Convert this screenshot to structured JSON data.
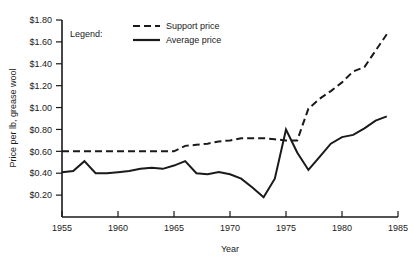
{
  "chart_data": {
    "type": "line",
    "title": "",
    "xlabel": "Year",
    "ylabel": "Price per lb, grease wool",
    "xlim": [
      1955,
      1985
    ],
    "ylim": [
      0,
      1.8
    ],
    "grid": false,
    "legend_position": "top-left",
    "legend_title": "Legend:",
    "xticks": [
      1955,
      1960,
      1965,
      1970,
      1975,
      1980,
      1985
    ],
    "xtick_labels": [
      "1955",
      "1960",
      "1965",
      "1970",
      "1975",
      "1980",
      "1985"
    ],
    "yticks": [
      0.2,
      0.4,
      0.6,
      0.8,
      1.0,
      1.2,
      1.4,
      1.6,
      1.8
    ],
    "ytick_labels": [
      "$0.20",
      "$0.40",
      "$0.60",
      "$0.80",
      "$1.00",
      "$1.20",
      "$1.40",
      "$1.60",
      "$1.80"
    ],
    "series": [
      {
        "name": "Support price",
        "style": "dashed",
        "color": "#1a1a1a",
        "x": [
          1955,
          1956,
          1957,
          1958,
          1959,
          1960,
          1961,
          1962,
          1963,
          1964,
          1965,
          1966,
          1967,
          1968,
          1969,
          1970,
          1971,
          1972,
          1973,
          1974,
          1975,
          1976,
          1977,
          1978,
          1979,
          1980,
          1981,
          1982,
          1983,
          1984
        ],
        "values": [
          0.6,
          0.6,
          0.6,
          0.6,
          0.6,
          0.6,
          0.6,
          0.6,
          0.6,
          0.6,
          0.6,
          0.65,
          0.66,
          0.67,
          0.69,
          0.7,
          0.72,
          0.72,
          0.72,
          0.71,
          0.7,
          0.7,
          0.99,
          1.08,
          1.15,
          1.23,
          1.33,
          1.37,
          1.52,
          1.67
        ]
      },
      {
        "name": "Average price",
        "style": "solid",
        "color": "#1a1a1a",
        "x": [
          1955,
          1956,
          1957,
          1958,
          1959,
          1960,
          1961,
          1962,
          1963,
          1964,
          1965,
          1966,
          1967,
          1968,
          1969,
          1970,
          1971,
          1972,
          1973,
          1974,
          1975,
          1976,
          1977,
          1978,
          1979,
          1980,
          1981,
          1982,
          1983,
          1984
        ],
        "values": [
          0.41,
          0.42,
          0.51,
          0.4,
          0.4,
          0.41,
          0.42,
          0.44,
          0.45,
          0.44,
          0.47,
          0.51,
          0.4,
          0.39,
          0.41,
          0.39,
          0.35,
          0.27,
          0.18,
          0.35,
          0.8,
          0.59,
          0.43,
          0.55,
          0.67,
          0.73,
          0.75,
          0.81,
          0.88,
          0.92
        ]
      }
    ],
    "annotations": []
  },
  "legend": {
    "label": "Legend:",
    "entries": [
      {
        "label": "Support price",
        "style": "dashed"
      },
      {
        "label": "Average price",
        "style": "solid"
      }
    ]
  },
  "axes": {
    "x_title": "Year",
    "y_title": "Price per lb, grease wool"
  }
}
